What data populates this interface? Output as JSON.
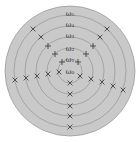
{
  "figure": {
    "background": "#ffffff",
    "disc_color": "#c9c9c9",
    "ring_color": "#9a9a9a",
    "marker_color": "#444444",
    "center": [
      70,
      71
    ],
    "outer_radius": 65,
    "ring_radii": [
      12,
      23,
      34,
      45,
      56
    ],
    "labels": [
      {
        "text": "ω₅",
        "x": 70,
        "y": 16
      },
      {
        "text": "ω₄",
        "x": 70,
        "y": 27
      },
      {
        "text": "ω₃",
        "x": 70,
        "y": 38
      },
      {
        "text": "ω₂",
        "x": 70,
        "y": 51
      },
      {
        "text": "ω₁",
        "x": 70,
        "y": 62
      },
      {
        "text": "ω₀",
        "x": 70,
        "y": 74
      }
    ],
    "markers": [
      {
        "type": "x",
        "x": 33,
        "y": 29
      },
      {
        "type": "x",
        "x": 41,
        "y": 37
      },
      {
        "type": "plus",
        "x": 48,
        "y": 46
      },
      {
        "type": "plus",
        "x": 55,
        "y": 54
      },
      {
        "type": "plus",
        "x": 62,
        "y": 62
      },
      {
        "type": "x",
        "x": 107,
        "y": 29
      },
      {
        "type": "x",
        "x": 100,
        "y": 37
      },
      {
        "type": "plus",
        "x": 93,
        "y": 46
      },
      {
        "type": "plus",
        "x": 86,
        "y": 54
      },
      {
        "type": "plus",
        "x": 78,
        "y": 62
      },
      {
        "type": "x",
        "x": 15,
        "y": 80
      },
      {
        "type": "x",
        "x": 26,
        "y": 78
      },
      {
        "type": "x",
        "x": 37,
        "y": 76
      },
      {
        "type": "x",
        "x": 48,
        "y": 74
      },
      {
        "type": "x",
        "x": 59,
        "y": 72
      },
      {
        "type": "x",
        "x": 80,
        "y": 76
      },
      {
        "type": "x",
        "x": 91,
        "y": 79
      },
      {
        "type": "x",
        "x": 102,
        "y": 82
      },
      {
        "type": "x",
        "x": 113,
        "y": 86
      },
      {
        "type": "x",
        "x": 123,
        "y": 90
      },
      {
        "type": "x",
        "x": 70,
        "y": 83
      },
      {
        "type": "x",
        "x": 70,
        "y": 94
      },
      {
        "type": "x",
        "x": 70,
        "y": 106
      },
      {
        "type": "x",
        "x": 70,
        "y": 116
      },
      {
        "type": "x",
        "x": 70,
        "y": 127
      }
    ]
  }
}
